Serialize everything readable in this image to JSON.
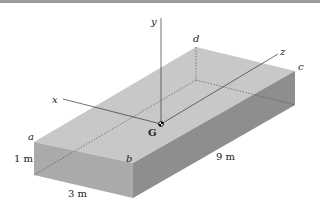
{
  "figure": {
    "points": {
      "a": "a",
      "b": "b",
      "c": "c",
      "d": "d",
      "G": "G"
    },
    "axes": {
      "x": "x",
      "y": "y",
      "z": "z"
    },
    "dimensions": {
      "height": "1 m",
      "width": "3 m",
      "length": "9 m"
    },
    "colors": {
      "top_face": "#c8c8c8",
      "front_face": "#a9a9a9",
      "right_face": "#8f8f8f",
      "edge": "#555555",
      "axis": "#333333"
    }
  }
}
